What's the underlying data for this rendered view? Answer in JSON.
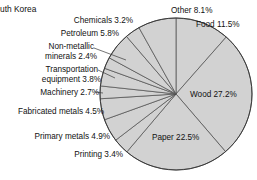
{
  "title": {
    "text": "uth Korea",
    "full_hint": "uth Korea"
  },
  "chart_data": {
    "type": "pie",
    "title": "uth Korea",
    "xlabel": "",
    "ylabel": "",
    "legend_position": "none",
    "grid": false,
    "start_angle_deg": 0,
    "direction": "clockwise",
    "units": "percent",
    "slice_fill": "#d2d2d2",
    "slice_stroke": "#4a4a4a",
    "categories": [
      "Food",
      "Wood",
      "Paper",
      "Printing",
      "Primary metals",
      "Fabricated metals",
      "Machinery",
      "Transportation equipment",
      "Non-metallic minerals",
      "Petroleum",
      "Chemicals",
      "Other"
    ],
    "values": [
      11.5,
      27.2,
      22.5,
      3.4,
      4.9,
      4.5,
      2.7,
      3.8,
      2.4,
      5.8,
      3.2,
      8.1
    ],
    "value_labels": [
      "Food 11.5%",
      "Wood 27.2%",
      "Paper 22.5%",
      "Printing 3.4%",
      "Primary metals 4.9%",
      "Fabricated metals 4.5%",
      "Machinery 2.7%",
      "Transportation equipment 3.8%",
      "Non-metallic minerals 2.4%",
      "Petroleum 5.8%",
      "Chemicals 3.2%",
      "Other 8.1%"
    ],
    "total": 100.0
  },
  "labels": {
    "food": "Food 11.5%",
    "wood": "Wood 27.2%",
    "paper": "Paper 22.5%",
    "printing": "Printing 3.4%",
    "primary_metals": "Primary metals 4.9%",
    "fabricated_metals": "Fabricated metals 4.5%",
    "machinery": "Machinery 2.7%",
    "transportation_line1": "Transportation",
    "transportation_line2": "equipment 3.8%",
    "nonmetallic_line1": "Non-metallic",
    "nonmetallic_line2": "minerals 2.4%",
    "petroleum": "Petroleum 5.8%",
    "chemicals": "Chemicals 3.2%",
    "other": "Other 8.1%"
  }
}
